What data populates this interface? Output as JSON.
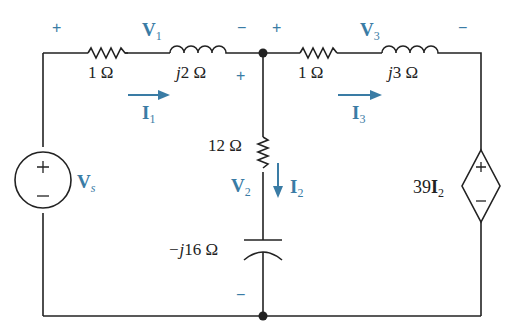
{
  "colors": {
    "wire": "#222222",
    "accent": "#3a7ca5",
    "background": "#ffffff"
  },
  "components": {
    "r1": {
      "value": "1 Ω"
    },
    "l1": {
      "value_prefix": "j",
      "value": "2 Ω"
    },
    "r2": {
      "value": "12 Ω"
    },
    "c1": {
      "value_prefix": "−j",
      "value": "16 Ω"
    },
    "r3": {
      "value": "1 Ω"
    },
    "l3": {
      "value_prefix": "j",
      "value": "3 Ω"
    },
    "source": {
      "name": "V",
      "sub": "s",
      "plus": "+",
      "minus": "−"
    },
    "dep_source": {
      "coef": "39",
      "var": "I",
      "sub": "2",
      "plus": "+",
      "minus": "−"
    }
  },
  "voltages": {
    "v1": {
      "name": "V",
      "sub": "1",
      "plus": "+",
      "minus": "−"
    },
    "v2": {
      "name": "V",
      "sub": "2",
      "plus": "+",
      "minus": "−"
    },
    "v3": {
      "name": "V",
      "sub": "3",
      "plus": "+",
      "minus": "−"
    }
  },
  "currents": {
    "i1": {
      "name": "I",
      "sub": "1"
    },
    "i2": {
      "name": "I",
      "sub": "2"
    },
    "i3": {
      "name": "I",
      "sub": "3"
    }
  }
}
